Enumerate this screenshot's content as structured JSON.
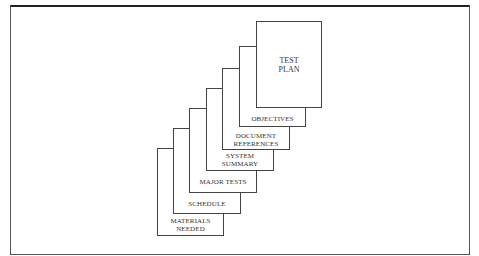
{
  "diagram": {
    "pages": [
      {
        "id": "materials-needed",
        "lines": [
          "MATERIALS",
          "NEEDED"
        ]
      },
      {
        "id": "schedule",
        "lines": [
          "SCHEDULE"
        ]
      },
      {
        "id": "major-tests",
        "lines": [
          "MAJOR TESTS"
        ]
      },
      {
        "id": "system-summary",
        "lines": [
          "SYSTEM",
          "SUMMARY"
        ]
      },
      {
        "id": "document-references",
        "lines": [
          "DOCUMENT",
          "REFERENCES"
        ]
      },
      {
        "id": "objectives",
        "lines": [
          "OBJECTIVES"
        ]
      },
      {
        "id": "test-plan",
        "lines": [
          "TEST",
          "PLAN"
        ]
      }
    ]
  }
}
